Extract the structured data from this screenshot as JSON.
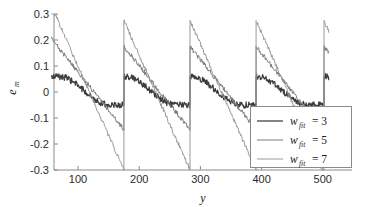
{
  "chart_data": {
    "type": "line",
    "title": "",
    "xlabel": "y",
    "ylabel": "e_m",
    "ylabel_base": "e",
    "ylabel_sub": "m",
    "xlim": [
      57,
      510
    ],
    "ylim": [
      -0.3,
      0.3
    ],
    "grid": false,
    "legend_position": "lower-right",
    "xticks": [
      100,
      200,
      300,
      400,
      500
    ],
    "xtick_labels": [
      "100",
      "200",
      "300",
      "400",
      "500"
    ],
    "yticks": [
      -0.3,
      -0.2,
      -0.1,
      0,
      0.1,
      0.2,
      0.3
    ],
    "ytick_labels": [
      "-0.3",
      "-0.2",
      "-0.1",
      "0",
      "0.1",
      "0.2",
      "0.3"
    ],
    "sawtooth_period": 108,
    "sawtooth_resets": [
      175,
      283,
      391,
      502
    ],
    "series": [
      {
        "name": "w_fit = 3",
        "legend_base": "w",
        "legend_sub": "fit",
        "legend_eq": "= 3",
        "color": "#3c3c3c",
        "width": 1.25,
        "peak_amplitude": 0.06,
        "trough_amplitude": -0.05,
        "noise": 0.012
      },
      {
        "name": "w_fit = 5",
        "legend_base": "w",
        "legend_sub": "fit",
        "legend_eq": "= 5",
        "color": "#7b7b7b",
        "width": 1.0,
        "peak_amplitude": 0.175,
        "trough_amplitude": -0.145,
        "noise": 0.009
      },
      {
        "name": "w_fit = 7",
        "legend_base": "w",
        "legend_sub": "fit",
        "legend_eq": "= 7",
        "color": "#9a9a9a",
        "width": 1.0,
        "peak_amplitude": 0.275,
        "trough_amplitude": -0.3,
        "noise": 0.008
      }
    ]
  },
  "axes": {
    "x_label": "y",
    "y_label_base": "e",
    "y_label_sub": "m"
  },
  "legend": {
    "entries": [
      {
        "base": "w",
        "sub": "fit",
        "eq": "= 3"
      },
      {
        "base": "w",
        "sub": "fit",
        "eq": "= 5"
      },
      {
        "base": "w",
        "sub": "fit",
        "eq": "= 7"
      }
    ]
  },
  "colors": {
    "axis": "#8a8a8a",
    "text": "#1a1a1a",
    "background": "#ffffff"
  }
}
